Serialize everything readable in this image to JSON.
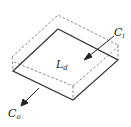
{
  "diagram": {
    "type": "3d-box-slab",
    "labels": {
      "center": "L",
      "center_sub": "d",
      "input": "C",
      "input_sub": "i",
      "output": "C",
      "output_sub": "o"
    },
    "colors": {
      "solid_line": "#333333",
      "dashed_line": "#777777",
      "background": "#ffffff"
    }
  }
}
